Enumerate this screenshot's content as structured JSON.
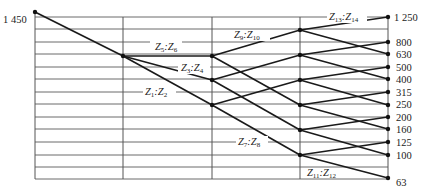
{
  "diagram": {
    "type": "speed-chart (gear transmission ray diagram)",
    "input_speed_label": "1 450",
    "output_speed_labels": [
      "1 250",
      "800",
      "630",
      "500",
      "400",
      "315",
      "250",
      "200",
      "160",
      "125",
      "100",
      "63"
    ],
    "gear_pair_labels": [
      {
        "id": "z1z2",
        "main": "Z",
        "a": "1",
        "b": "2"
      },
      {
        "id": "z3z4",
        "main": "Z",
        "a": "3",
        "b": "4"
      },
      {
        "id": "z5z6",
        "main": "Z",
        "a": "5",
        "b": "6"
      },
      {
        "id": "z7z8",
        "main": "Z",
        "a": "7",
        "b": "8"
      },
      {
        "id": "z9z10",
        "main": "Z",
        "a": "9",
        "b": "10"
      },
      {
        "id": "z11z12",
        "main": "Z",
        "a": "11",
        "b": "12"
      },
      {
        "id": "z13z14",
        "main": "Z",
        "a": "13",
        "b": "14"
      }
    ],
    "colors": {
      "line": "#1a1a1a",
      "grid": "#6b6b6b",
      "background": "#ffffff"
    }
  }
}
